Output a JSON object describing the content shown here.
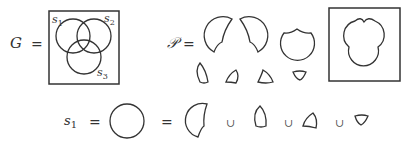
{
  "diagram": {
    "type": "venn-decomposition",
    "top_left": {
      "symbol": "G",
      "equals": "=",
      "sets": [
        "s1",
        "s2",
        "s3"
      ],
      "set_labels": [
        {
          "name": "s",
          "sub": "1"
        },
        {
          "name": "s",
          "sub": "2"
        },
        {
          "name": "s",
          "sub": "3"
        }
      ]
    },
    "top_right": {
      "symbol": "𝒫",
      "equals": "=",
      "pieces_count": 7,
      "union_shape": "outline of s1 ∪ s2 ∪ s3"
    },
    "bottom": {
      "lhs": {
        "name": "s",
        "sub": "1"
      },
      "equals_1": "=",
      "equals_2": "=",
      "union": "∪",
      "description": "s1 circle equals union of its 4 atomic regions"
    }
  }
}
